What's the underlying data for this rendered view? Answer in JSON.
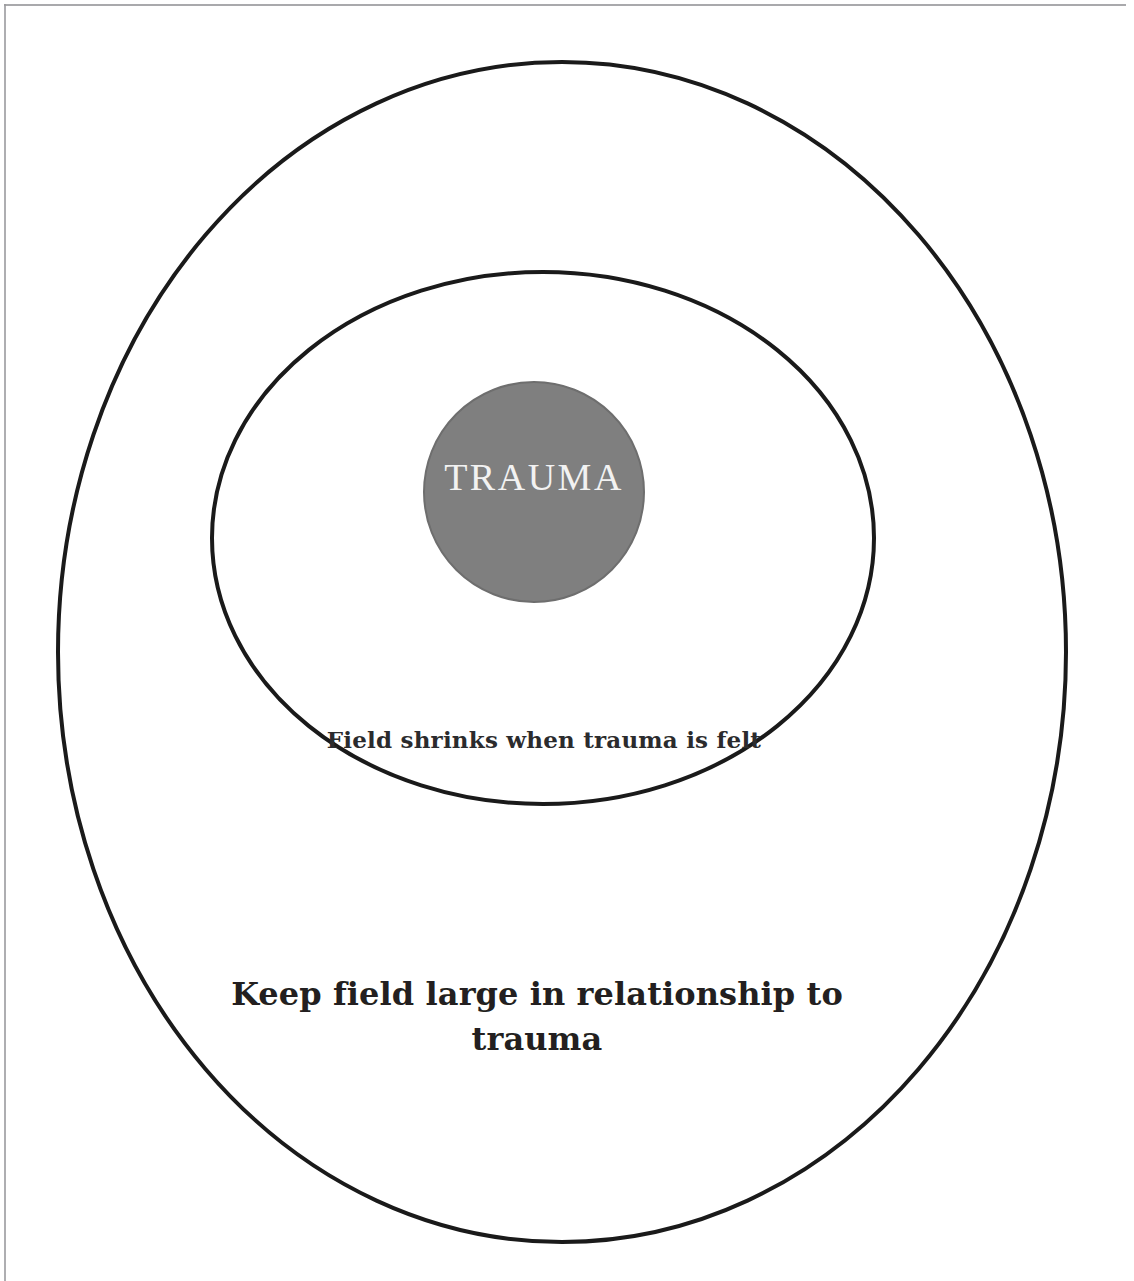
{
  "page": {
    "background_color": "#ffffff",
    "border_color": "#9a9a9e"
  },
  "diagram": {
    "type": "concentric-circles",
    "stroke_color": "#1a1a1a",
    "shapes": [
      {
        "name": "outer-field-ellipse",
        "role": "outer field boundary",
        "cx": 562,
        "cy": 652,
        "rx": 504,
        "ry": 590,
        "fill": "none",
        "stroke": "#1a1a1a",
        "stroke_width": 4
      },
      {
        "name": "middle-field-ellipse",
        "role": "shrunken field boundary",
        "cx": 543,
        "cy": 538,
        "rx": 331,
        "ry": 266,
        "fill": "none",
        "stroke": "#1a1a1a",
        "stroke_width": 4
      },
      {
        "name": "trauma-circle",
        "role": "trauma core",
        "cx": 534,
        "cy": 492,
        "rx": 110,
        "ry": 110,
        "fill": "#7f7f7f",
        "stroke": "#6e6e6e",
        "stroke_width": 2
      }
    ],
    "labels": {
      "trauma": "TRAUMA",
      "field_shrinks": "Field shrinks when trauma is felt",
      "keep_field_large": "Keep field large in relationship to trauma"
    },
    "label_colors": {
      "trauma": "#f2f2f2",
      "field_shrinks": "#2b2b2d",
      "keep_field_large": "#231f20"
    }
  }
}
